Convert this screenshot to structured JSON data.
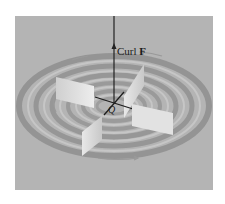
{
  "figure": {
    "background_color": "#ffffff",
    "panel_color": "#b4b4b4",
    "ring_color": "#8a8a8a",
    "paddle_color": "#dcdcdc",
    "axis_color": "#222222"
  },
  "labels": {
    "curl_text": "Curl ",
    "curl_vector": "F",
    "point": "Q"
  }
}
